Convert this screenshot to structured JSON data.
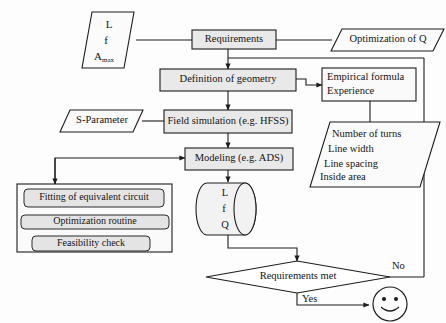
{
  "diagram": {
    "colors": {
      "background": "#fdfdfd",
      "line": "#1c1c1c",
      "process_fill": "#e9e9e9",
      "plain_fill": "#fafafa",
      "text": "#141414"
    },
    "nodes": {
      "input_lf": {
        "shape": "parallelogram",
        "lines": [
          "L",
          "f",
          "A"
        ],
        "subscript": "max"
      },
      "requirements": {
        "shape": "process",
        "label": "Requirements"
      },
      "optimization_q": {
        "shape": "parallelogram",
        "label": "Optimization of Q"
      },
      "definition_geometry": {
        "shape": "process",
        "label": "Definition of geometry"
      },
      "empirical": {
        "shape": "box",
        "line1": "Empirical formula",
        "line2": "Experience"
      },
      "s_parameter": {
        "shape": "parallelogram",
        "label": "S-Parameter"
      },
      "field_simulation": {
        "shape": "process",
        "label": "Field simulation (e.g. HFSS)"
      },
      "geometry_params": {
        "shape": "parallelogram",
        "lines": [
          "Number of turns",
          "Line width",
          "Line spacing",
          "Inside area"
        ]
      },
      "modeling": {
        "shape": "process",
        "label": "Modeling (e.g. ADS)"
      },
      "extraction_group": {
        "shape": "group-box",
        "items": [
          "Fitting of equivalent circuit",
          "Optimization routine",
          "Feasibility check"
        ]
      },
      "results_store": {
        "shape": "cylinder",
        "lines": [
          "L",
          "f",
          "Q"
        ]
      },
      "decision": {
        "shape": "diamond",
        "label": "Requirements met"
      },
      "smiley": {
        "shape": "circle-face",
        "label": "smiley-face"
      }
    },
    "edge_labels": {
      "no": "No",
      "yes": "Yes"
    }
  }
}
